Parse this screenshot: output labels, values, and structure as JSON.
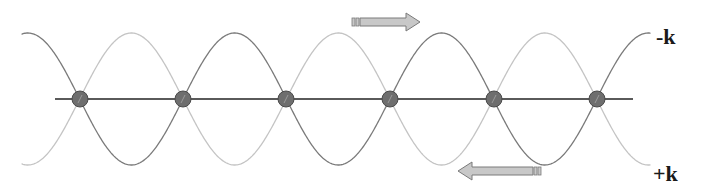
{
  "diagram": {
    "type": "standing-wave",
    "labels": {
      "upper_wave": "-k",
      "lower_wave": "+k"
    },
    "axis": {
      "x_start": 55,
      "x_end": 633,
      "y": 99
    },
    "nodes": {
      "count": 6,
      "x_positions": [
        80,
        183,
        286,
        390,
        494,
        597
      ],
      "y": 99,
      "radius": 8,
      "fill": "#6e6e6e",
      "stroke": "#4a4a4a"
    },
    "waves": [
      {
        "name": "-k wave",
        "direction": "rightward",
        "amplitude": 66,
        "half_period": 103.4,
        "phase_ref_x": 183,
        "sign": -1,
        "color": "#7a7a7a",
        "end_label": "-k"
      },
      {
        "name": "+k wave",
        "direction": "leftward",
        "amplitude": 66,
        "half_period": 103.4,
        "phase_ref_x": 183,
        "sign": 1,
        "color": "#c4c4c4",
        "end_label": "+k"
      }
    ],
    "wave_x_range": [
      22,
      650
    ],
    "arrows": [
      {
        "name": "rightward-arrow",
        "direction": "right",
        "x": 352,
        "y": 22,
        "length": 68,
        "fill": "#c8c8c8",
        "stroke": "#7a7a7a"
      },
      {
        "name": "leftward-arrow",
        "direction": "left",
        "x": 541,
        "y": 171,
        "length": 83,
        "fill": "#c8c8c8",
        "stroke": "#7a7a7a"
      }
    ],
    "colors": {
      "axis": "#5a5a5a",
      "arrow_fill": "#c8c8c8",
      "arrow_stroke": "#7a7a7a",
      "text": "#1a1a1a"
    }
  }
}
